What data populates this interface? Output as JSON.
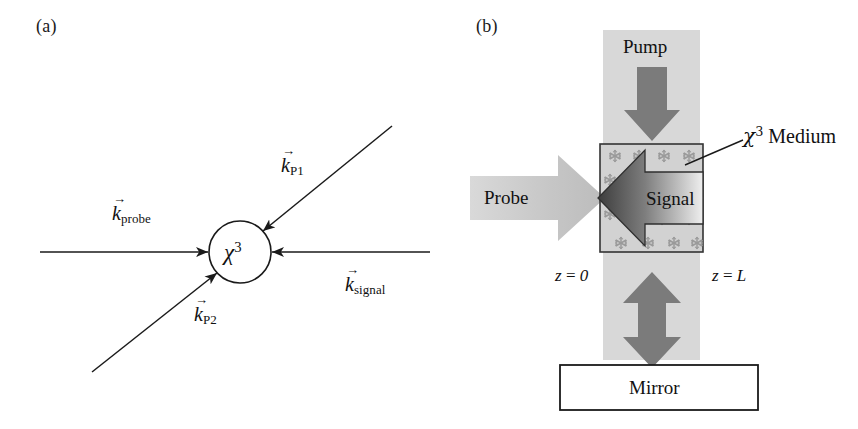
{
  "figure": {
    "type": "two-panel optical four-wave-mixing schematic",
    "width": 858,
    "height": 429,
    "background": "#ffffff"
  },
  "panel_a": {
    "label": "(a)",
    "medium_symbol": {
      "base": "χ",
      "superscript": "3"
    },
    "vectors": [
      {
        "name": "k-probe",
        "arrow_glyph": "→",
        "symbol": "k",
        "subscript": "probe",
        "direction": "incoming from left, horizontal",
        "label_x": 112,
        "label_y": 196
      },
      {
        "name": "k-P1",
        "arrow_glyph": "→",
        "symbol": "k",
        "subscript": "P1",
        "direction": "incoming from upper right, diagonal",
        "label_x": 281,
        "label_y": 148
      },
      {
        "name": "k-signal",
        "arrow_glyph": "→",
        "symbol": "k",
        "subscript": "signal",
        "direction": "incoming from right, horizontal",
        "label_x": 345,
        "label_y": 267
      },
      {
        "name": "k-P2",
        "arrow_glyph": "→",
        "symbol": "k",
        "subscript": "P2",
        "direction": "incoming from lower left, diagonal",
        "label_x": 194,
        "label_y": 297
      }
    ]
  },
  "panel_b": {
    "label": "(b)",
    "pump_label": "Pump",
    "probe_label": "Probe",
    "signal_label": "Signal",
    "mirror_label": "Mirror",
    "medium_label": {
      "base": "χ",
      "superscript": "3",
      "text": " Medium"
    },
    "z_start": {
      "var": "z",
      "eq": " = ",
      "value": "0"
    },
    "z_end": {
      "var": "z",
      "eq": " = ",
      "value": "L"
    }
  },
  "colors": {
    "ink": "#111111",
    "stroke": "#1a1a1a",
    "beam_light_gray": "#d8d8d8",
    "arrow_mid_gray": "#7b7b7b",
    "probe_arrow_gray": "#c9c9c9",
    "medium_fill": "#d2d2d2",
    "snowflake_gray": "#9a9a9a",
    "signal_dark": "#4a4a4a",
    "signal_light": "#e8e8e8",
    "white": "#ffffff"
  }
}
